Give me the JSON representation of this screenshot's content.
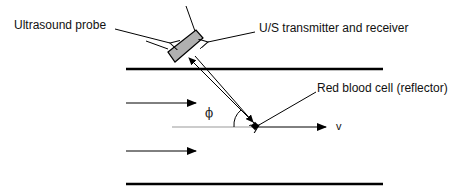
{
  "diagram": {
    "labels": {
      "probe": "Ultrasound probe",
      "transducer": "U/S transmitter and receiver",
      "reflector": "Red blood cell (reflector)",
      "angle": "ϕ",
      "velocity": "v"
    },
    "colors": {
      "line": "#000000",
      "probe_fill": "#b0b0b0",
      "axis_line": "#999999"
    }
  }
}
